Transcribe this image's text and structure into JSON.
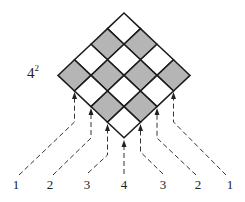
{
  "figure": {
    "title_label": "4",
    "title_exponent": "2",
    "grid_size": 4,
    "colors": {
      "shaded": "#b5b5b5",
      "unshaded": "#ffffff",
      "stroke": "#1a1a1a",
      "arrow": "#333333"
    },
    "bottom_labels": [
      "1",
      "2",
      "3",
      "4",
      "3",
      "2",
      "1"
    ]
  }
}
